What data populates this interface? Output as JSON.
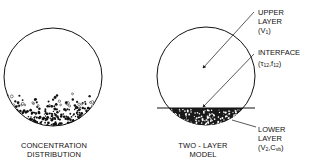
{
  "diagram": {
    "left_panel": {
      "caption_line1": "CONCENTRATION",
      "caption_line2": "DISTRIBUTION"
    },
    "right_panel": {
      "caption_line1": "TWO - LAYER",
      "caption_line2": "MODEL",
      "annotations": [
        {
          "line1": "UPPER",
          "line2": "LAYER",
          "line3_main": "(V",
          "line3_sub": "1",
          "line3_end": ")"
        },
        {
          "line1": "INTERFACE",
          "line2_a": "(τ",
          "line2_sub1": "12",
          "line2_b": ",f",
          "line2_sub2": "12",
          "line2_c": ")"
        },
        {
          "line1": "LOWER",
          "line2": "LAYER",
          "line3_a": "(V",
          "line3_sub1": "2",
          "line3_b": ",C",
          "line3_sub2": "vb",
          "line3_c": ")"
        }
      ]
    }
  }
}
